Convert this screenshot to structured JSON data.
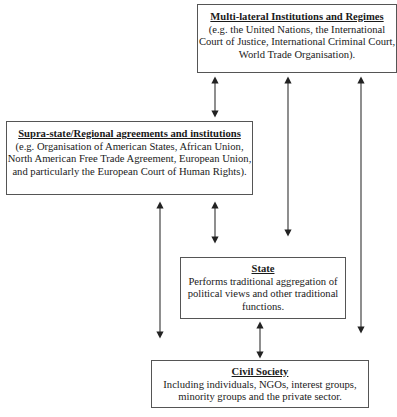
{
  "diagram": {
    "boxes": {
      "multi": {
        "title": "Multi-lateral Institutions and Regimes",
        "desc": "(e.g. the United Nations, the International Court of Justice, International Criminal Court, World Trade Organisation)."
      },
      "supra": {
        "title": "Supra-state/Regional agreements and institutions",
        "desc": "(e.g. Organisation of American States, African Union, North American Free Trade Agreement, European Union, and particularly the European Court of Human Rights)."
      },
      "state": {
        "title": "State",
        "desc": "Performs traditional aggregation of political views and other traditional functions."
      },
      "civil": {
        "title": "Civil Society",
        "desc": "Including individuals, NGOs, interest groups, minority groups and the private sector."
      }
    },
    "arrows": [
      {
        "from": "multi",
        "to": "supra",
        "type": "bidirectional"
      },
      {
        "from": "multi",
        "to": "state",
        "type": "bidirectional"
      },
      {
        "from": "multi",
        "to": "civil",
        "type": "bidirectional"
      },
      {
        "from": "supra",
        "to": "state",
        "type": "bidirectional"
      },
      {
        "from": "supra",
        "to": "civil",
        "type": "bidirectional"
      },
      {
        "from": "state",
        "to": "civil",
        "type": "bidirectional"
      }
    ],
    "colors": {
      "border": "#555555",
      "arrow": "#333333",
      "text": "#1a1a1a"
    }
  }
}
